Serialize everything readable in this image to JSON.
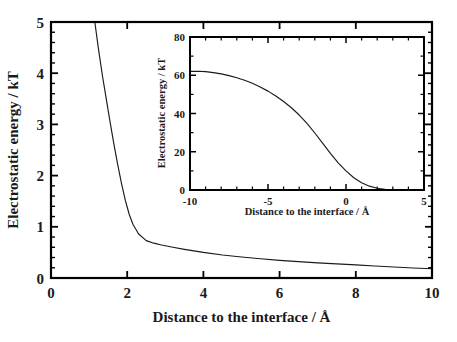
{
  "figure": {
    "background_color": "#ffffff",
    "line_color": "#1a1a1a",
    "axis_color": "#000000"
  },
  "chart_data": [
    {
      "id": "main-plot",
      "type": "line",
      "title": "",
      "xlabel": "Distance to the interface  /  Å",
      "ylabel": "Electrostatic energy / kT",
      "xlim": [
        0,
        10
      ],
      "ylim": [
        0,
        5
      ],
      "xticks": [
        0,
        2,
        4,
        6,
        8,
        10
      ],
      "xtick_labels": [
        "0",
        "2",
        "4",
        "6",
        "8",
        "10"
      ],
      "yticks": [
        0,
        1,
        2,
        3,
        4,
        5
      ],
      "ytick_labels": [
        "0",
        "1",
        "2",
        "3",
        "4",
        "5"
      ],
      "y_minor_tick_count": 4,
      "grid": false,
      "legend": "none",
      "frame": "box-all-sides-inward-ticks",
      "series": [
        {
          "name": "Electrostatic energy vs distance",
          "x": [
            1.15,
            1.25,
            1.35,
            1.45,
            1.55,
            1.65,
            1.75,
            1.85,
            1.95,
            2.05,
            2.15,
            2.3,
            2.5,
            2.7,
            2.9,
            3.2,
            3.5,
            4.0,
            4.5,
            5.0,
            5.5,
            6.0,
            6.5,
            7.0,
            7.5,
            8.0,
            8.5,
            9.0,
            9.5,
            10.0
          ],
          "y": [
            5.0,
            4.45,
            3.95,
            3.5,
            3.05,
            2.62,
            2.22,
            1.85,
            1.52,
            1.25,
            1.05,
            0.86,
            0.73,
            0.68,
            0.645,
            0.6,
            0.56,
            0.5,
            0.45,
            0.41,
            0.375,
            0.345,
            0.32,
            0.295,
            0.275,
            0.255,
            0.235,
            0.215,
            0.195,
            0.18
          ]
        }
      ]
    },
    {
      "id": "inset-plot",
      "type": "line",
      "title": "",
      "xlabel": "Distance to the interface  /  Å",
      "ylabel": "Electrostatic energy  /  kT",
      "xlim": [
        -10,
        5
      ],
      "ylim": [
        0,
        80
      ],
      "xticks": [
        -10,
        -5,
        0,
        5
      ],
      "xtick_labels": [
        "-10",
        "-5",
        "0",
        "5"
      ],
      "yticks": [
        0,
        20,
        40,
        60,
        80
      ],
      "ytick_labels": [
        "0",
        "20",
        "40",
        "60",
        "80"
      ],
      "x_minor_tick_count": 4,
      "y_minor_tick_count": 1,
      "grid": false,
      "legend": "none",
      "frame": "box-all-sides-inward-ticks",
      "series": [
        {
          "name": "Electrostatic energy vs distance (wide range)",
          "x": [
            -10.0,
            -9.5,
            -9.0,
            -8.5,
            -8.0,
            -7.5,
            -7.0,
            -6.5,
            -6.0,
            -5.5,
            -5.0,
            -4.5,
            -4.0,
            -3.5,
            -3.0,
            -2.5,
            -2.0,
            -1.5,
            -1.0,
            -0.5,
            0.0,
            0.5,
            1.0,
            1.5,
            2.0,
            2.5,
            3.0,
            4.0,
            5.0
          ],
          "y": [
            62.0,
            62.1,
            61.9,
            61.4,
            60.7,
            59.8,
            58.7,
            57.4,
            55.8,
            53.9,
            51.7,
            49.2,
            46.3,
            43.0,
            39.2,
            34.8,
            29.8,
            24.5,
            19.2,
            14.2,
            10.0,
            6.4,
            3.8,
            2.0,
            0.9,
            0.4,
            0.2,
            0.1,
            0.05
          ]
        }
      ]
    }
  ],
  "caption": {
    "partial_text": ""
  }
}
